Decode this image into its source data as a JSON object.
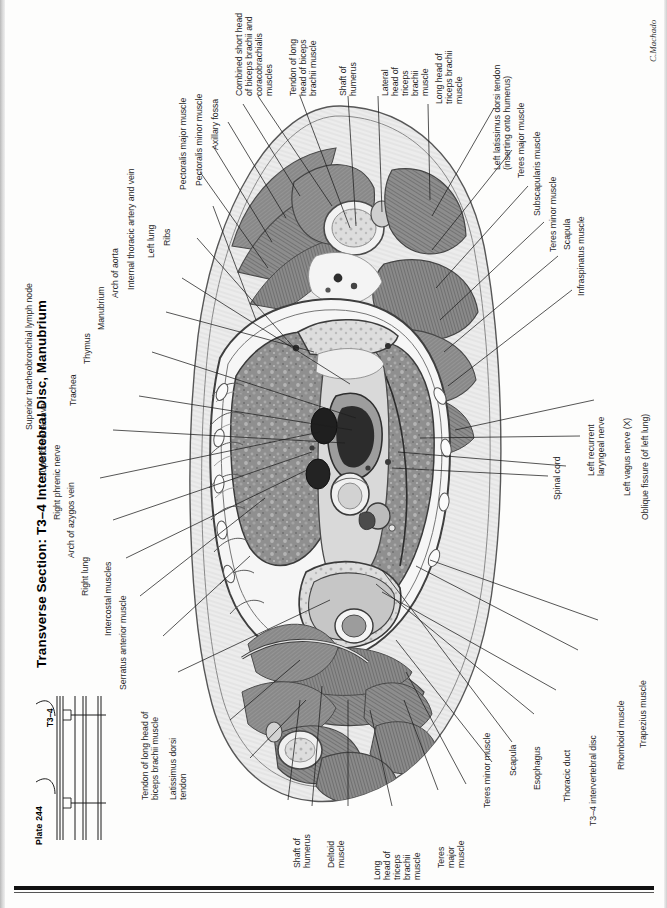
{
  "page": {
    "title": "Transverse Section: T3–4 Intervertebral Disc, Manubrium",
    "plate_number": "Plate 244",
    "level_tag": "T3–4",
    "signature": "C.Machado",
    "orientation": "rotated-90-ccw",
    "ink_color": "#242424",
    "rule_color": "#111111"
  },
  "labels": {
    "left_column": [
      {
        "id": "superior-tracheobronchial-lymph-node",
        "text": "Superior tracheobronchial lymph node"
      },
      {
        "id": "superior-vena-cava",
        "text": "Superior vena cava"
      },
      {
        "id": "right-phrenic-nerve",
        "text": "Right phrenic nerve"
      },
      {
        "id": "arch-of-azygos-vein",
        "text": "Arch of azygos vein"
      },
      {
        "id": "right-lung",
        "text": "Right lung"
      },
      {
        "id": "intercostal-muscles",
        "text": "Intercostal muscles"
      },
      {
        "id": "serratus-anterior-muscle",
        "text": "Serratus anterior muscle"
      },
      {
        "id": "tendon-of-long-head-of-biceps-brachii-muscle",
        "text": "Tendon of long head of\nbiceps brachii muscle"
      },
      {
        "id": "latissimus-dorsi-tendon",
        "text": "Latissimus dorsi\ntendon"
      },
      {
        "id": "trachea",
        "text": "Trachea"
      },
      {
        "id": "thymus",
        "text": "Thymus"
      },
      {
        "id": "manubrium",
        "text": "Manubrium"
      },
      {
        "id": "arch-of-aorta",
        "text": "Arch of aorta"
      },
      {
        "id": "internal-thoracic-artery-and-vein",
        "text": "Internal thoracic artery and vein"
      },
      {
        "id": "left-lung",
        "text": "Left lung"
      },
      {
        "id": "ribs",
        "text": "Ribs"
      },
      {
        "id": "pectoralis-major-muscle",
        "text": "Pectoralis major muscle"
      },
      {
        "id": "pectoralis-minor-muscle",
        "text": "Pectoralis minor muscle"
      },
      {
        "id": "axillary-fossa",
        "text": "Axillary fossa"
      }
    ],
    "top_column": [
      {
        "id": "combined-short-head-of-biceps-brachii-and-coracobrachialis-muscles",
        "text": "Combined short head\nof biceps brachii and\ncoracobrachialis muscles"
      },
      {
        "id": "tendon-of-long-head-of-biceps-brachii-muscle-top",
        "text": "Tendon of long\nhead of biceps\nbrachii muscle"
      },
      {
        "id": "shaft-of-humerus-top",
        "text": "Shaft of\nhumerus"
      },
      {
        "id": "lateral-head-of-triceps-brachii-muscle",
        "text": "Lateral\nhead of\ntriceps\nbrachii\nmuscle"
      },
      {
        "id": "long-head-of-triceps-brachii-muscle-top",
        "text": "Long head of\ntriceps brachii\nmuscle"
      }
    ],
    "right_column": [
      {
        "id": "left-latissimus-dorsi-tendon",
        "text": "Left latissimus dorsi tendon\n(inserting onto humerus)"
      },
      {
        "id": "teres-major-muscle-right",
        "text": "Teres major muscle"
      },
      {
        "id": "subscapularis-muscle",
        "text": "Subscapularis muscle"
      },
      {
        "id": "teres-minor-muscle-right",
        "text": "Teres minor muscle"
      },
      {
        "id": "scapula-right",
        "text": "Scapula"
      },
      {
        "id": "infraspinatus-muscle",
        "text": "Infraspinatus muscle"
      },
      {
        "id": "oblique-fissure-of-left-lung",
        "text": "Oblique fissure (of left lung)"
      },
      {
        "id": "left-vagus-nerve",
        "text": "Left vagus nerve (X)"
      },
      {
        "id": "left-recurrent-laryngeal-nerve",
        "text": "Left recurrent\nlaryngeal nerve"
      },
      {
        "id": "spinal-cord",
        "text": "Spinal cord"
      },
      {
        "id": "trapezius-muscle",
        "text": "Trapezius muscle"
      },
      {
        "id": "rhomboid-muscle",
        "text": "Rhomboid muscle"
      },
      {
        "id": "t3-4-intervertebral-disc",
        "text": "T3–4 intervertebral disc"
      },
      {
        "id": "thoracic-duct",
        "text": "Thoracic duct"
      },
      {
        "id": "esophagus",
        "text": "Esophagus"
      },
      {
        "id": "scapula-bottom",
        "text": "Scapula"
      },
      {
        "id": "teres-minor-muscle-bottom",
        "text": "Teres minor muscle"
      }
    ],
    "bottom_column": [
      {
        "id": "teres-major-muscle-bottom",
        "text": "Teres\nmajor\nmuscle"
      },
      {
        "id": "long-head-of-triceps-brachii-muscle-bottom",
        "text": "Long\nhead of\ntriceps\nbrachii\nmuscle"
      },
      {
        "id": "deltoid-muscle",
        "text": "Deltoid\nmuscle"
      },
      {
        "id": "shaft-of-humerus-bottom",
        "text": "Shaft of\nhumerus"
      }
    ]
  }
}
